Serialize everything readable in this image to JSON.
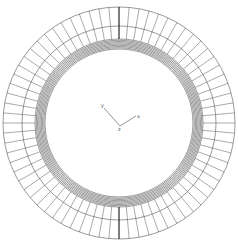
{
  "diagram": {
    "type": "annular-mesh",
    "center": [
      119,
      123
    ],
    "outer_radius": 116,
    "mid_radius": 97,
    "band_outer_radius": 84,
    "band_inner_radius": 74,
    "radial_divisions": 72,
    "line_color": "#555555",
    "band_color": "#444444",
    "bold_spoke_angles": [
      90,
      270
    ]
  },
  "axes": {
    "y_label": "y",
    "x_label": "x",
    "origin_label": "z"
  }
}
